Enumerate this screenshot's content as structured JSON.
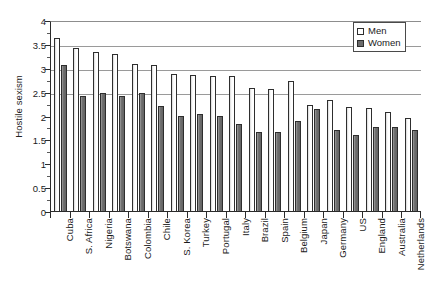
{
  "chart_data": {
    "type": "bar",
    "title": "",
    "subtitle": "",
    "xlabel": "",
    "ylabel": "Hostile sexism",
    "ylim": [
      0,
      4
    ],
    "yticks": [
      0,
      0.5,
      1,
      1.5,
      2,
      2.5,
      3,
      3.5,
      4
    ],
    "ytick_labels": [
      "0",
      "0.5",
      "1",
      "1.5",
      "2",
      "2.5",
      "3",
      "3.5",
      "4"
    ],
    "grid": true,
    "gridlines_at": [
      2.5,
      3,
      3.5,
      4
    ],
    "legend_position": "top-right",
    "orientation": "vertical",
    "categories": [
      "Cuba",
      "S. Africa",
      "Nigeria",
      "Botswana",
      "Colombia",
      "Chile",
      "S. Korea",
      "Turkey",
      "Portugal",
      "Italy",
      "Brazil",
      "Spain",
      "Belgium",
      "Japan",
      "Germany",
      "US",
      "England",
      "Australia",
      "Netherlands"
    ],
    "series": [
      {
        "name": "Men",
        "color": "#ffffff",
        "values": [
          3.65,
          3.43,
          3.35,
          3.3,
          3.1,
          3.07,
          2.9,
          2.87,
          2.85,
          2.85,
          2.6,
          2.57,
          2.75,
          2.25,
          2.35,
          2.2,
          2.17,
          2.1,
          1.97
        ]
      },
      {
        "name": "Women",
        "color": "#6b6b6b",
        "values": [
          3.07,
          2.42,
          2.5,
          2.42,
          2.5,
          2.22,
          2.02,
          2.05,
          2.02,
          1.85,
          1.68,
          1.67,
          1.9,
          2.15,
          1.72,
          1.62,
          1.78,
          1.77,
          1.72
        ]
      }
    ]
  },
  "legend": {
    "entries": [
      {
        "label": "Men"
      },
      {
        "label": "Women"
      }
    ]
  },
  "axes": {
    "y_title": "Hostile sexism"
  }
}
